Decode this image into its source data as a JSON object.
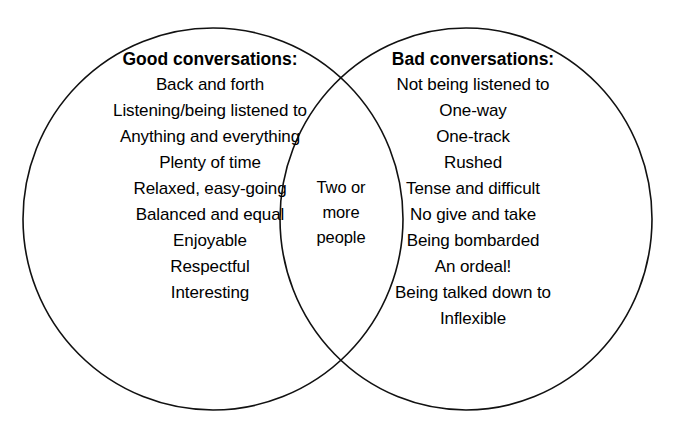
{
  "diagram": {
    "type": "venn",
    "background_color": "#ffffff",
    "stroke_color": "#111111",
    "text_color": "#000000",
    "left_set": {
      "heading": "Good conversations:",
      "items": [
        "Back and forth",
        "Listening/being listened to",
        "Anything and everything",
        "Plenty of time",
        "Relaxed, easy-going",
        "Balanced and equal",
        "Enjoyable",
        "Respectful",
        "Interesting"
      ]
    },
    "right_set": {
      "heading": "Bad conversations:",
      "items": [
        "Not being listened to",
        "One-way",
        "One-track",
        "Rushed",
        "Tense and difficult",
        "No give and take",
        "Being bombarded",
        "An ordeal!",
        "Being talked down to",
        "Inflexible"
      ]
    },
    "intersection": {
      "lines": [
        "Two or",
        "more",
        "people"
      ]
    }
  }
}
